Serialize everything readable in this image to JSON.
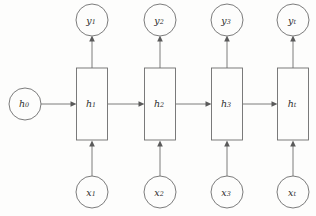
{
  "diagram": {
    "type": "rnn-unrolled-computation-graph",
    "geometry": {
      "width": 316,
      "height": 216,
      "columns_x": [
        92,
        160,
        227,
        293
      ],
      "output_row_y": 20,
      "hidden_row_y": 104,
      "input_row_y": 192,
      "circle_radius": 16,
      "box_width": 31,
      "box_height": 72,
      "initial_state_x": 25
    },
    "colors": {
      "background": "#fdfdfc",
      "stroke": "#6d6d6d",
      "arrow_fill": "#5a5a5a",
      "label": "#2b2b2b"
    },
    "initial_state": {
      "id": "h0",
      "shape": "circle",
      "base": "h",
      "subscript": "0"
    },
    "outputs": [
      {
        "id": "y1",
        "shape": "circle",
        "base": "y",
        "subscript": "1"
      },
      {
        "id": "y2",
        "shape": "circle",
        "base": "y",
        "subscript": "2"
      },
      {
        "id": "y3",
        "shape": "circle",
        "base": "y",
        "subscript": "3"
      },
      {
        "id": "yt",
        "shape": "circle",
        "base": "y",
        "subscript": "t"
      }
    ],
    "hidden_states": [
      {
        "id": "h1",
        "shape": "rect",
        "base": "h",
        "subscript": "1"
      },
      {
        "id": "h2",
        "shape": "rect",
        "base": "h",
        "subscript": "2"
      },
      {
        "id": "h3",
        "shape": "rect",
        "base": "h",
        "subscript": "3"
      },
      {
        "id": "ht",
        "shape": "rect",
        "base": "h",
        "subscript": "t"
      }
    ],
    "inputs": [
      {
        "id": "x1",
        "shape": "circle",
        "base": "x",
        "subscript": "1"
      },
      {
        "id": "x2",
        "shape": "circle",
        "base": "x",
        "subscript": "2"
      },
      {
        "id": "x3",
        "shape": "circle",
        "base": "x",
        "subscript": "3"
      },
      {
        "id": "xt",
        "shape": "circle",
        "base": "x",
        "subscript": "t"
      }
    ],
    "edges": [
      {
        "id": "edge-h0-h1",
        "from": "h0",
        "to": "h1",
        "direction": "right"
      },
      {
        "id": "edge-h1-h2",
        "from": "h1",
        "to": "h2",
        "direction": "right"
      },
      {
        "id": "edge-h2-h3",
        "from": "h2",
        "to": "h3",
        "direction": "right"
      },
      {
        "id": "edge-h3-ht",
        "from": "h3",
        "to": "ht",
        "direction": "right"
      },
      {
        "id": "edge-x1-h1",
        "from": "x1",
        "to": "h1",
        "direction": "up"
      },
      {
        "id": "edge-x2-h2",
        "from": "x2",
        "to": "h2",
        "direction": "up"
      },
      {
        "id": "edge-x3-h3",
        "from": "x3",
        "to": "h3",
        "direction": "up"
      },
      {
        "id": "edge-xt-ht",
        "from": "xt",
        "to": "ht",
        "direction": "up"
      },
      {
        "id": "edge-h1-y1",
        "from": "h1",
        "to": "y1",
        "direction": "up"
      },
      {
        "id": "edge-h2-y2",
        "from": "h2",
        "to": "y2",
        "direction": "up"
      },
      {
        "id": "edge-h3-y3",
        "from": "h3",
        "to": "y3",
        "direction": "up"
      },
      {
        "id": "edge-ht-yt",
        "from": "ht",
        "to": "yt",
        "direction": "up"
      }
    ]
  }
}
